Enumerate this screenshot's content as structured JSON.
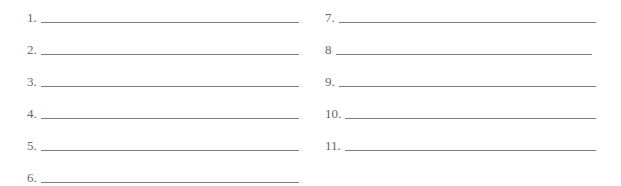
{
  "worksheet": {
    "left_column": [
      {
        "label": "1.",
        "value": ""
      },
      {
        "label": "2.",
        "value": ""
      },
      {
        "label": "3.",
        "value": ""
      },
      {
        "label": "4.",
        "value": ""
      },
      {
        "label": "5.",
        "value": ""
      },
      {
        "label": "6.",
        "value": ""
      }
    ],
    "right_column": [
      {
        "label": "7.",
        "value": ""
      },
      {
        "label": "8",
        "value": ""
      },
      {
        "label": "9.",
        "value": ""
      },
      {
        "label": "10.",
        "value": ""
      },
      {
        "label": "11.",
        "value": ""
      }
    ]
  }
}
